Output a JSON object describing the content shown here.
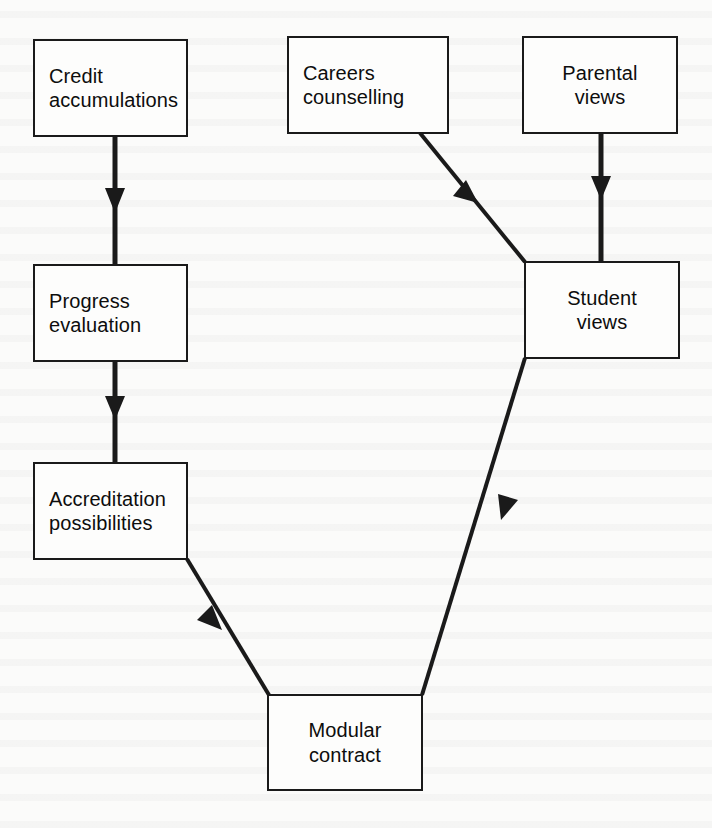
{
  "diagram": {
    "type": "flowchart",
    "background_color": "#fbfbfa",
    "box_border_color": "#1a1a1a",
    "arrow_color": "#1a1a1a",
    "nodes": [
      {
        "id": "credit-accumulations",
        "line1": "Credit",
        "line2": "accumulations",
        "x": 33,
        "y": 39,
        "w": 155,
        "h": 98
      },
      {
        "id": "progress-evaluation",
        "line1": "Progress",
        "line2": "evaluation",
        "x": 33,
        "y": 264,
        "w": 155,
        "h": 98
      },
      {
        "id": "accreditation-possibilities",
        "line1": "Accreditation",
        "line2": "possibilities",
        "x": 33,
        "y": 462,
        "w": 155,
        "h": 98
      },
      {
        "id": "careers-counselling",
        "line1": "Careers",
        "line2": "counselling",
        "x": 287,
        "y": 36,
        "w": 162,
        "h": 98
      },
      {
        "id": "parental-views",
        "line1": "Parental",
        "line2": "views",
        "x": 522,
        "y": 36,
        "w": 156,
        "h": 98
      },
      {
        "id": "student-views",
        "line1": "Student",
        "line2": "views",
        "x": 524,
        "y": 261,
        "w": 156,
        "h": 98
      },
      {
        "id": "modular-contract",
        "line1": "Modular",
        "line2": "contract",
        "x": 267,
        "y": 694,
        "w": 156,
        "h": 97
      }
    ],
    "edges": [
      {
        "id": "credit-to-progress",
        "from": "credit-accumulations",
        "to": "progress-evaluation",
        "style": "straight-vertical"
      },
      {
        "id": "progress-to-accreditation",
        "from": "progress-evaluation",
        "to": "accreditation-possibilities",
        "style": "straight-vertical"
      },
      {
        "id": "accreditation-to-modular",
        "from": "accreditation-possibilities",
        "to": "modular-contract",
        "style": "diagonal-down-right"
      },
      {
        "id": "careers-to-student",
        "from": "careers-counselling",
        "to": "student-views",
        "style": "diagonal-down-right"
      },
      {
        "id": "parental-to-student",
        "from": "parental-views",
        "to": "student-views",
        "style": "straight-vertical"
      },
      {
        "id": "student-to-modular",
        "from": "student-views",
        "to": "modular-contract",
        "style": "diagonal-down-left"
      }
    ]
  }
}
